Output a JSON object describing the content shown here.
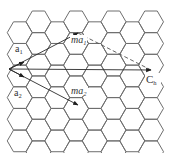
{
  "diagram": {
    "lattice": {
      "type": "hexagonal",
      "orientation": "flat-top"
    },
    "vectors": [
      {
        "id": "a1",
        "label_main": "a",
        "label_sub": "1",
        "style": "solid-arrow",
        "direction": "up-right"
      },
      {
        "id": "a2",
        "label_main": "a",
        "label_sub": "2",
        "style": "solid-arrow",
        "direction": "down-right"
      },
      {
        "id": "ma1",
        "label_main": "ma",
        "label_sub": "1",
        "style": "solid-arrow",
        "direction": "up-right"
      },
      {
        "id": "ma2",
        "label_main": "ma",
        "label_sub": "2",
        "style": "solid-arrow",
        "direction": "down-right"
      },
      {
        "id": "Ch",
        "label_main": "C",
        "label_sub": "h",
        "style": "solid-arrow",
        "direction": "right"
      },
      {
        "id": "ma1-to-Ch",
        "label_main": "",
        "label_sub": "",
        "style": "dashed-line",
        "direction": "down-right"
      }
    ],
    "colors": {
      "lattice": "#6e6e6e",
      "vectors": "#2a2a2a",
      "labels": "#333333",
      "background": "#ffffff"
    }
  }
}
